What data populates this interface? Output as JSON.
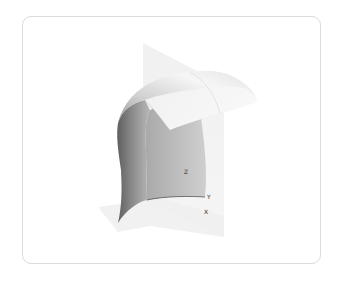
{
  "viewer": {
    "type": "3d-surface-plot",
    "axes": {
      "x_label": "X",
      "y_label": "Y",
      "z_label": "Z"
    },
    "colors": {
      "card_border": "#dcdcdc",
      "plane": "#eeeeee",
      "surface_dark": "#6e6e6e",
      "surface_light": "#f4f4f4",
      "label": "#333333"
    }
  }
}
